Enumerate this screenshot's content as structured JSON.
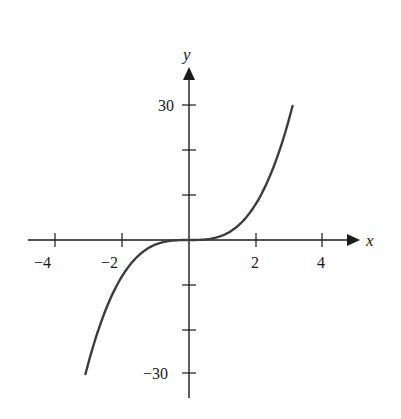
{
  "chart_data": {
    "type": "line",
    "title": "",
    "xlabel": "x",
    "ylabel": "y",
    "xlim": [
      -4.8,
      5.0
    ],
    "ylim": [
      -35,
      38
    ],
    "x_ticks": [
      -4,
      -2,
      2,
      4
    ],
    "x_tick_labels": [
      "−4",
      "−2",
      "2",
      "4"
    ],
    "y_ticks": [
      -30,
      -20,
      -10,
      10,
      20,
      30
    ],
    "y_tick_labels": [
      "−30",
      "",
      "",
      "",
      "",
      "30"
    ],
    "grid": false,
    "legend": null,
    "series": [
      {
        "name": "y = x^3",
        "function": "x^3",
        "x": [
          -3.1,
          -3.0,
          -2.5,
          -2.0,
          -1.5,
          -1.0,
          -0.5,
          0,
          0.5,
          1.0,
          1.5,
          2.0,
          2.5,
          3.0,
          3.1
        ],
        "y": [
          -29.8,
          -27,
          -15.6,
          -8,
          -3.4,
          -1,
          -0.1,
          0,
          0.1,
          1,
          3.4,
          8,
          15.6,
          27,
          29.8
        ]
      }
    ],
    "colors": {
      "axis": "#1a1a1a",
      "curve": "#3c3c3c"
    }
  }
}
